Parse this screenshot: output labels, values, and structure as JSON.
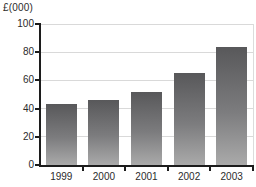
{
  "chart_data": {
    "type": "bar",
    "title": "",
    "xlabel": "",
    "ylabel": "£(000)",
    "categories": [
      "1999",
      "2000",
      "2001",
      "2002",
      "2003"
    ],
    "values": [
      43,
      46,
      52,
      65,
      84
    ],
    "ylim": [
      0,
      100
    ],
    "yticks": [
      0,
      20,
      40,
      60,
      80,
      100
    ],
    "grid": true,
    "legend": false
  },
  "colors": {
    "background": "#ffffff",
    "bar_gradient_top": "#58585a",
    "bar_gradient_bottom": "#aaaaaa",
    "axis": "#1c1c1c",
    "gridline": "#d9d9d9",
    "text": "#2b2b2b"
  }
}
